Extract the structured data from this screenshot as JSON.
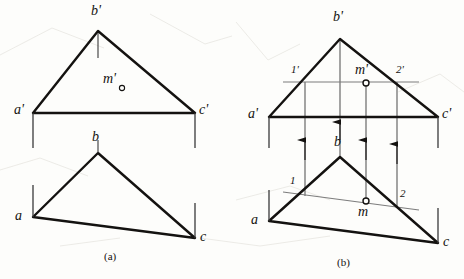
{
  "figure": {
    "title_captions": [
      {
        "text": "(a)",
        "x": 110,
        "y": 252
      },
      {
        "text": "(b)",
        "x": 343,
        "y": 258
      }
    ],
    "colors": {
      "ink": "#141210",
      "thin_line": "#6f6f6f",
      "paper": "#fdfdfb"
    }
  },
  "panel_a": {
    "name": "panel-a",
    "front_view": {
      "name": "front-view-triangle",
      "vertices": {
        "a_prime": {
          "label": "a'",
          "x": 33,
          "y": 113,
          "lx": 14,
          "ly": 104
        },
        "b_prime": {
          "label": "b'",
          "x": 98,
          "y": 31,
          "lx": 91,
          "ly": 6
        },
        "c_prime": {
          "label": "c'",
          "x": 195,
          "y": 113,
          "lx": 200,
          "ly": 104
        }
      },
      "point_m_prime": {
        "label": "m'",
        "lx": 104,
        "ly": 72,
        "cx": 122,
        "cy": 88,
        "r": 2.6
      },
      "tick_below_apex": {
        "x": 98,
        "y1": 31,
        "y2": 58
      },
      "ground_ticks": [
        {
          "x": 33,
          "y1": 113,
          "y2": 148
        },
        {
          "x": 195,
          "y1": 113,
          "y2": 148
        }
      ]
    },
    "top_view": {
      "name": "top-view-triangle",
      "vertices": {
        "a": {
          "label": "a",
          "x": 33,
          "y": 217,
          "lx": 16,
          "ly": 211
        },
        "b": {
          "label": "b",
          "x": 98,
          "y": 153,
          "lx": 92,
          "ly": 131
        },
        "c": {
          "label": "c",
          "x": 195,
          "y": 238,
          "lx": 201,
          "ly": 231
        }
      },
      "ground_ticks": [
        {
          "x": 33,
          "y1": 185,
          "y2": 217
        },
        {
          "x": 195,
          "y1": 203,
          "y2": 238
        }
      ]
    }
  },
  "panel_b": {
    "name": "panel-b",
    "front_view": {
      "name": "front-view-triangle",
      "vertices": {
        "a_prime": {
          "label": "a'",
          "x": 269,
          "y": 117,
          "lx": 249,
          "ly": 108
        },
        "b_prime": {
          "label": "b'",
          "x": 340,
          "y": 39,
          "lx": 333,
          "ly": 12
        },
        "c_prime": {
          "label": "c'",
          "x": 438,
          "y": 117,
          "lx": 443,
          "ly": 108
        }
      },
      "aux_line": {
        "name": "auxiliary-line-1p-2p",
        "x1": 283,
        "y1": 82,
        "x2": 419,
        "y2": 82
      },
      "point_1_prime": {
        "label": "1'",
        "lx": 292,
        "ly": 66,
        "cx": 305,
        "cy": 82
      },
      "point_2_prime": {
        "label": "2'",
        "lx": 397,
        "ly": 66,
        "cx": 397,
        "cy": 82
      },
      "point_m_prime": {
        "label": "m'",
        "lx": 355,
        "ly": 65,
        "cx": 366,
        "cy": 83,
        "r": 3.0
      },
      "tick_apex": {
        "x": 340,
        "y1": 39,
        "y2": 117
      },
      "ground_ticks": [
        {
          "x": 269,
          "y1": 117,
          "y2": 148
        },
        {
          "x": 438,
          "y1": 117,
          "y2": 148
        }
      ]
    },
    "top_view": {
      "name": "top-view-triangle",
      "vertices": {
        "a": {
          "label": "a",
          "x": 269,
          "y": 221,
          "lx": 252,
          "ly": 215
        },
        "b": {
          "label": "b",
          "x": 340,
          "y": 157,
          "lx": 334,
          "ly": 136
        },
        "c": {
          "label": "c",
          "x": 438,
          "y": 243,
          "lx": 444,
          "ly": 236
        }
      },
      "aux_line": {
        "name": "auxiliary-line-1-2",
        "x1": 283,
        "y1": 192,
        "x2": 419,
        "y2": 210
      },
      "point_1": {
        "label": "1",
        "lx": 291,
        "ly": 177,
        "cx": 305,
        "cy": 195
      },
      "point_2": {
        "label": "2",
        "lx": 401,
        "ly": 190,
        "cx": 397,
        "cy": 207
      },
      "point_m": {
        "label": "m",
        "lx": 359,
        "ly": 207,
        "cx": 366,
        "cy": 201,
        "r": 3.0
      },
      "ground_ticks": [
        {
          "x": 269,
          "y1": 190,
          "y2": 221
        },
        {
          "x": 438,
          "y1": 208,
          "y2": 243
        }
      ]
    },
    "projection_lines": [
      {
        "name": "projector-point-1",
        "x": 305,
        "y_top": 82,
        "y_bottom": 196,
        "arrow_y": 150
      },
      {
        "name": "projector-apex-b",
        "x": 340,
        "y_top": 39,
        "y_bottom": 157,
        "arrow_y": 128
      },
      {
        "name": "projector-point-m",
        "x": 366,
        "y_top": 83,
        "y_bottom": 201,
        "arrow_y": 150
      },
      {
        "name": "projector-point-2",
        "x": 397,
        "y_top": 82,
        "y_bottom": 207,
        "arrow_y": 152
      }
    ]
  }
}
